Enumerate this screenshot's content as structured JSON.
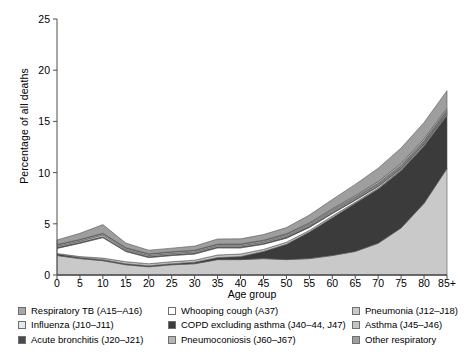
{
  "chart_data": {
    "type": "area",
    "title": "",
    "subtitle": "",
    "xlabel": "Age group",
    "ylabel": "Percentage of all deaths",
    "xtick_labels": [
      "0",
      "5",
      "10",
      "15",
      "20",
      "25",
      "30",
      "35",
      "40",
      "45",
      "50",
      "55",
      "60",
      "65",
      "70",
      "75",
      "80",
      "85+"
    ],
    "x": [
      0,
      5,
      10,
      15,
      20,
      25,
      30,
      35,
      40,
      45,
      50,
      55,
      60,
      65,
      70,
      75,
      80,
      85
    ],
    "ytick_labels": [
      "0",
      "5",
      "10",
      "15",
      "20",
      "25"
    ],
    "yticks": [
      0,
      5,
      10,
      15,
      20,
      25
    ],
    "ylim": [
      0,
      25
    ],
    "xlim": [
      0,
      85
    ],
    "grid": false,
    "legend_position": "below",
    "stacked": true,
    "stack_order_bottom_to_top": [
      "Pneumonia (J12–J18)",
      "COPD excluding asthma (J40–44, J47)",
      "Asthma (J45–J46)",
      "Whooping cough (A37)",
      "Acute bronchitis (J20–J21)",
      "Influenza (J10–J11)",
      "Respiratory TB (A15–A16)",
      "Pneumoconiosis (J60–J67)",
      "Other respiratory"
    ],
    "series": [
      {
        "name": "Pneumonia (J12–J18)",
        "color": "#c9c9c9",
        "values": [
          1.9,
          1.6,
          1.4,
          1.0,
          0.8,
          1.0,
          1.1,
          1.5,
          1.5,
          1.6,
          1.5,
          1.6,
          1.9,
          2.3,
          3.1,
          4.6,
          7.0,
          10.4
        ]
      },
      {
        "name": "COPD excluding asthma (J40–44, J47)",
        "color": "#3b3b3b",
        "values": [
          0.15,
          0.1,
          0.1,
          0.1,
          0.1,
          0.1,
          0.15,
          0.2,
          0.3,
          0.7,
          1.5,
          2.6,
          3.7,
          4.7,
          5.3,
          5.6,
          5.6,
          5.2
        ]
      },
      {
        "name": "Asthma (J45–J46)",
        "color": "#c4c4c4",
        "values": [
          0.05,
          0.1,
          0.15,
          0.2,
          0.2,
          0.2,
          0.2,
          0.25,
          0.25,
          0.2,
          0.2,
          0.15,
          0.15,
          0.1,
          0.1,
          0.1,
          0.1,
          0.1
        ]
      },
      {
        "name": "Whooping cough (A37)",
        "color": "#ffffff",
        "values": [
          0.5,
          1.3,
          2.0,
          1.0,
          0.6,
          0.6,
          0.6,
          0.7,
          0.6,
          0.5,
          0.4,
          0.3,
          0.25,
          0.2,
          0.15,
          0.1,
          0.1,
          0.1
        ]
      },
      {
        "name": "Acute bronchitis (J20–J21)",
        "color": "#4a4a4a",
        "values": [
          0.1,
          0.1,
          0.1,
          0.1,
          0.1,
          0.1,
          0.1,
          0.1,
          0.1,
          0.1,
          0.1,
          0.1,
          0.1,
          0.1,
          0.1,
          0.1,
          0.1,
          0.1
        ]
      },
      {
        "name": "Influenza (J10–J11)",
        "color": "#e8e8e8",
        "values": [
          0.1,
          0.1,
          0.15,
          0.1,
          0.1,
          0.1,
          0.1,
          0.1,
          0.1,
          0.1,
          0.1,
          0.1,
          0.1,
          0.1,
          0.1,
          0.1,
          0.1,
          0.1
        ]
      },
      {
        "name": "Respiratory TB (A15–A16)",
        "color": "#a8a8a8",
        "values": [
          0.15,
          0.15,
          0.15,
          0.15,
          0.15,
          0.15,
          0.15,
          0.15,
          0.15,
          0.15,
          0.15,
          0.15,
          0.15,
          0.1,
          0.1,
          0.1,
          0.1,
          0.1
        ]
      },
      {
        "name": "Pneumoconiosis (J60–J67)",
        "color": "#b5b5b5",
        "values": [
          0.02,
          0.02,
          0.02,
          0.02,
          0.02,
          0.02,
          0.02,
          0.02,
          0.03,
          0.05,
          0.08,
          0.1,
          0.12,
          0.15,
          0.18,
          0.2,
          0.2,
          0.2
        ]
      },
      {
        "name": "Other respiratory",
        "color": "#9e9e9e",
        "values": [
          0.45,
          0.6,
          0.85,
          0.45,
          0.35,
          0.35,
          0.4,
          0.5,
          0.5,
          0.55,
          0.6,
          0.75,
          0.9,
          1.1,
          1.3,
          1.5,
          1.6,
          1.7
        ]
      }
    ],
    "totals": [
      3.4,
      4.1,
      4.9,
      3.1,
      2.4,
      2.6,
      2.8,
      3.5,
      3.5,
      3.9,
      4.6,
      5.9,
      7.4,
      8.9,
      10.4,
      12.4,
      14.9,
      17.9
    ]
  },
  "legend": {
    "columns": [
      {
        "items": [
          {
            "label": "Respiratory TB (A15–A16)",
            "color": "#a8a8a8"
          },
          {
            "label": "Influenza (J10–J11)",
            "color": "#e8e8e8"
          },
          {
            "label": "Acute bronchitis (J20–J21)",
            "color": "#4a4a4a"
          }
        ]
      },
      {
        "items": [
          {
            "label": "Whooping cough (A37)",
            "color": "#ffffff"
          },
          {
            "label": "COPD excluding asthma (J40–44, J47)",
            "color": "#3b3b3b"
          },
          {
            "label": "Pneumoconiosis (J60–J67)",
            "color": "#b5b5b5"
          }
        ]
      },
      {
        "items": [
          {
            "label": "Pneumonia (J12–J18)",
            "color": "#c9c9c9"
          },
          {
            "label": "Asthma (J45–J46)",
            "color": "#c4c4c4"
          },
          {
            "label": "Other respiratory",
            "color": "#9e9e9e"
          }
        ]
      }
    ]
  },
  "axes": {
    "x_axis_title": "Age group",
    "y_axis_title": "Percentage of all deaths"
  }
}
